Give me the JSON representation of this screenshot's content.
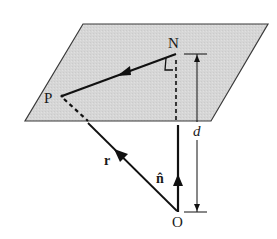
{
  "diagram": {
    "type": "vector-geometry",
    "colors": {
      "plane_fill": "#d6d6d6",
      "plane_stroke": "#3a3a3a",
      "line": "#111111",
      "background": "#ffffff"
    },
    "plane": {
      "corners": [
        [
          83,
          24
        ],
        [
          268,
          24
        ],
        [
          211,
          121
        ],
        [
          25,
          121
        ]
      ]
    },
    "points": {
      "N": {
        "label": "N",
        "x": 176,
        "y": 54
      },
      "P": {
        "label": "P",
        "x": 62,
        "y": 96
      },
      "O": {
        "label": "O",
        "x": 178,
        "y": 212
      }
    },
    "vectors": {
      "r": {
        "label": "r",
        "from": "O",
        "to": "P"
      },
      "n_hat": {
        "label": "n̂",
        "from": "O",
        "direction": "up"
      },
      "NP": {
        "label": "",
        "from": "N",
        "to": "P"
      }
    },
    "dimension": {
      "label": "d",
      "from_y": 54,
      "to_y": 212,
      "x": 197
    },
    "labels": {
      "N": "N",
      "P": "P",
      "O": "O",
      "r": "r",
      "n_hat": "n̂",
      "d": "d"
    }
  }
}
